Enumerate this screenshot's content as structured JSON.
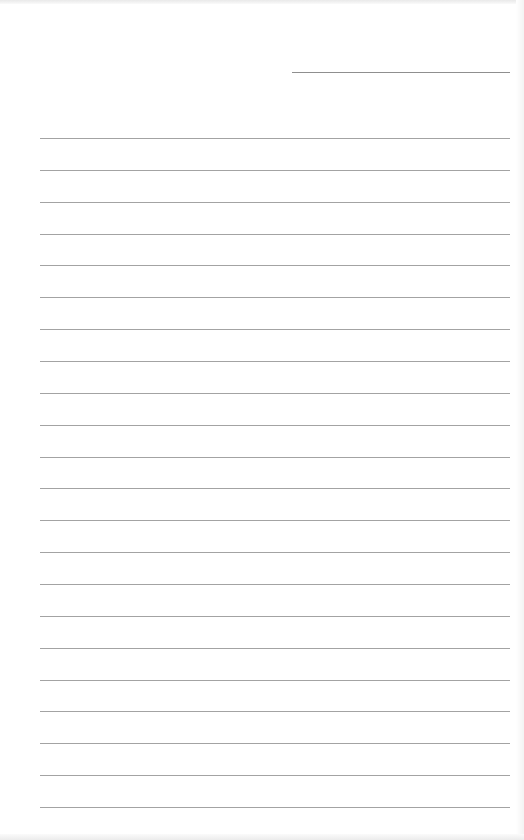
{
  "page": {
    "type": "lined-paper",
    "background": "#ffffff",
    "rule_color": "#a3a3a3"
  },
  "header_line": {
    "x1": 292,
    "x2": 510,
    "y": 72,
    "color": "#8f8f8f"
  },
  "rules": {
    "x1": 40,
    "x2": 510,
    "first_y": 138,
    "spacing": 31.86,
    "count": 22
  }
}
